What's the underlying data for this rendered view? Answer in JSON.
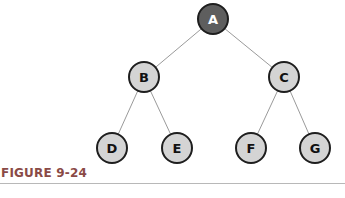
{
  "figure": {
    "caption": "FIGURE 9-24",
    "colors": {
      "root_fill": "#5e5e5e",
      "node_fill": "#d4d4d4",
      "stroke": "#222222",
      "edge": "#999999",
      "caption": "#8a4a46"
    }
  },
  "tree": {
    "nodes": [
      {
        "id": "A",
        "label": "A",
        "x": 213,
        "y": 19,
        "root": true
      },
      {
        "id": "B",
        "label": "B",
        "x": 144,
        "y": 77
      },
      {
        "id": "C",
        "label": "C",
        "x": 284,
        "y": 77
      },
      {
        "id": "D",
        "label": "D",
        "x": 112,
        "y": 148
      },
      {
        "id": "E",
        "label": "E",
        "x": 177,
        "y": 148
      },
      {
        "id": "F",
        "label": "F",
        "x": 251,
        "y": 148
      },
      {
        "id": "G",
        "label": "G",
        "x": 315,
        "y": 148
      }
    ],
    "edges": [
      [
        "A",
        "B"
      ],
      [
        "A",
        "C"
      ],
      [
        "B",
        "D"
      ],
      [
        "B",
        "E"
      ],
      [
        "C",
        "F"
      ],
      [
        "C",
        "G"
      ]
    ]
  }
}
